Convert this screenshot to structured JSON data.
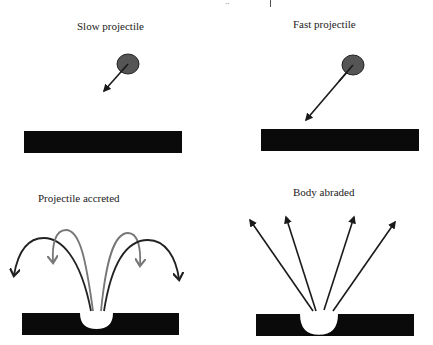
{
  "diagram": {
    "type": "impact-outcomes-schematic",
    "top_fragment": {
      "text": "..",
      "bar": true
    },
    "panels": [
      {
        "id": "slow",
        "title": "Slow projectile",
        "projectile": {
          "cx": 128,
          "cy": 64,
          "rx": 11,
          "ry": 10,
          "fill": "#555555"
        },
        "velocity_arrow": {
          "from": [
            128,
            64
          ],
          "to": [
            104,
            91
          ]
        },
        "surface": {
          "x": 24,
          "y": 131,
          "w": 158,
          "h": 22
        }
      },
      {
        "id": "fast",
        "title": "Fast projectile",
        "projectile": {
          "cx": 353,
          "cy": 65,
          "rx": 11,
          "ry": 10,
          "fill": "#555555"
        },
        "velocity_arrow": {
          "from": [
            353,
            65
          ],
          "to": [
            306,
            120
          ]
        },
        "surface": {
          "x": 261,
          "y": 129,
          "w": 158,
          "h": 22
        }
      },
      {
        "id": "accreted",
        "title": "Projectile accreted",
        "surface": {
          "x": 22,
          "y": 313,
          "w": 157,
          "h": 22,
          "crater": {
            "x1": 80,
            "x2": 113,
            "depth": 10
          }
        },
        "ejecta": [
          {
            "color": "#222222",
            "path": "M91,311 C80,255 60,238 44,238 C28,238 18,252 14,275"
          },
          {
            "color": "#777777",
            "path": "M93,311 C86,260 80,230 66,230 C55,230 52,245 53,262"
          },
          {
            "color": "#777777",
            "path": "M101,311 C106,260 114,233 128,233 C138,233 141,248 140,265"
          },
          {
            "color": "#222222",
            "path": "M104,311 C112,260 128,240 148,240 C166,240 176,258 179,279"
          }
        ]
      },
      {
        "id": "abraded",
        "title": "Body abraded",
        "surface": {
          "x": 256,
          "y": 314,
          "w": 158,
          "h": 22,
          "crater": {
            "x1": 300,
            "x2": 338,
            "depth": 13
          }
        },
        "ejecta": [
          {
            "from": [
              313,
              311
            ],
            "to": [
              250,
              220
            ]
          },
          {
            "from": [
              316,
              311
            ],
            "to": [
              286,
              217
            ]
          },
          {
            "from": [
              324,
              310
            ],
            "to": [
              354,
              217
            ]
          },
          {
            "from": [
              333,
              311
            ],
            "to": [
              395,
              222
            ]
          }
        ]
      }
    ],
    "colors": {
      "surface": "#0a0a0a",
      "arrow": "#1a1a1a",
      "arc_dark": "#222222",
      "arc_light": "#777777"
    }
  }
}
